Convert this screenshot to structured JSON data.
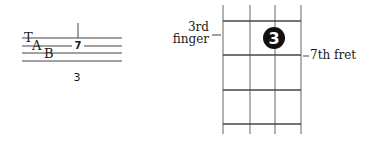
{
  "tab": {
    "clef": [
      "T",
      "A",
      "B"
    ],
    "fret_number": "7",
    "finger_label": "3",
    "string_count": 4
  },
  "fretboard": {
    "finger_dot": "3",
    "finger_label_line1": "3rd",
    "finger_label_line2": "finger",
    "fret_label": "7th fret",
    "strings": 4,
    "frets": 4
  },
  "colors": {
    "ink": "#1a1a1a",
    "line": "#555555",
    "background": "#ffffff"
  }
}
